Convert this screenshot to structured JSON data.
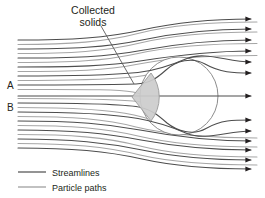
{
  "figure": {
    "background_color": "#ffffff",
    "annotation": {
      "name": "collected-solids",
      "line1": "Collected",
      "line2": "solids",
      "leader_from": [
        101,
        26
      ],
      "leader_to": [
        134,
        84
      ],
      "text_color": "#231f20"
    },
    "flow_labels": [
      {
        "name": "A",
        "label": "A",
        "x": 10,
        "y": 89
      },
      {
        "name": "B",
        "label": "B",
        "x": 10,
        "y": 111
      }
    ],
    "collector": {
      "name": "cylindrical-collector",
      "shape": "circle",
      "cx": 179,
      "cy": 96,
      "r": 39,
      "fill": "#ffffff",
      "stroke": "#8c8c8c"
    },
    "deposit": {
      "name": "collected-solids-deposit",
      "shape": "triangle",
      "apex": [
        132,
        97
      ],
      "top": [
        150,
        73
      ],
      "bottom": [
        150,
        122
      ],
      "fill": "#cccccc",
      "stroke": "#9a9a9a"
    },
    "streamline_color": "#4d4d4d",
    "particle_path_color": "#a6a6a6",
    "inlet_x": 18,
    "outlet_x": 257,
    "arrow_color": "#231f20",
    "streamline_rows_y": [
      40,
      49,
      58,
      67,
      76,
      85,
      94,
      103,
      112,
      121,
      130,
      139,
      148
    ],
    "particle_rows_y": [
      44.5,
      53.5,
      62.5,
      71.5,
      80.5,
      89.5,
      98.5,
      107.5,
      116.5,
      125.5,
      134.5,
      143.5
    ]
  },
  "legend": {
    "name": "legend",
    "items": [
      {
        "name": "legend-streamlines",
        "label": "Streamlines",
        "color": "#4d4d4d"
      },
      {
        "name": "legend-particle-paths",
        "label": "Particle paths",
        "color": "#a6a6a6"
      }
    ],
    "swatch_x1": 18,
    "swatch_x2": 46,
    "label_x": 52,
    "row1_y": 172,
    "row2_y": 187
  }
}
